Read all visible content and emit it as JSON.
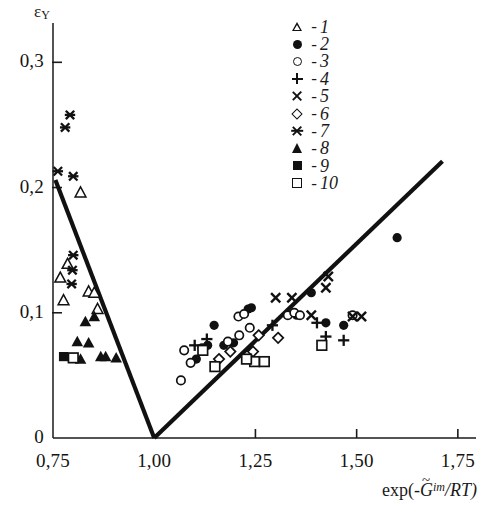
{
  "chart_data": {
    "type": "scatter",
    "title": "",
    "xlabel": "exp(-G̃^im/RT)",
    "ylabel": "ε_Y",
    "xlabel_parts": {
      "prefix": "exp(-",
      "symbol": "G",
      "tilde": "~",
      "sup": "im",
      "suffix": "/RT)"
    },
    "ylabel_parts": {
      "symbol": "ε",
      "sub": "Y"
    },
    "xlim": [
      0.75,
      1.78
    ],
    "ylim": [
      0.0,
      0.325
    ],
    "grid": false,
    "legend_position": "top-right",
    "xticks": [
      0.75,
      1.0,
      1.25,
      1.5,
      1.75
    ],
    "xticklabels": [
      "0,75",
      "1,00",
      "1,25",
      "1,50",
      "1,75"
    ],
    "yticks": [
      0.0,
      0.1,
      0.2,
      0.3
    ],
    "yticklabels": [
      "0",
      "0,1",
      "0,2",
      "0,3"
    ],
    "trend_lines": [
      {
        "name": "left-branch",
        "points": [
          [
            0.756,
            0.206
          ],
          [
            1.0,
            0.0
          ]
        ]
      },
      {
        "name": "right-branch",
        "points": [
          [
            1.0,
            0.0
          ],
          [
            1.712,
            0.221
          ]
        ]
      }
    ],
    "legend": [
      {
        "n": "1",
        "marker": "open-triangle"
      },
      {
        "n": "2",
        "marker": "filled-circle"
      },
      {
        "n": "3",
        "marker": "open-circle"
      },
      {
        "n": "4",
        "marker": "plus"
      },
      {
        "n": "5",
        "marker": "cross"
      },
      {
        "n": "6",
        "marker": "open-diamond"
      },
      {
        "n": "7",
        "marker": "star"
      },
      {
        "n": "8",
        "marker": "filled-triangle"
      },
      {
        "n": "9",
        "marker": "filled-square"
      },
      {
        "n": "10",
        "marker": "open-square"
      }
    ],
    "legend_dash": "-",
    "series": [
      {
        "name": "1",
        "marker": "open-triangle",
        "points": [
          [
            0.818,
            0.196
          ],
          [
            0.786,
            0.139
          ],
          [
            0.768,
            0.128
          ],
          [
            0.838,
            0.117
          ],
          [
            0.776,
            0.11
          ],
          [
            0.86,
            0.103
          ],
          [
            0.852,
            0.116
          ]
        ]
      },
      {
        "name": "2",
        "marker": "filled-circle",
        "points": [
          [
            1.6,
            0.16
          ],
          [
            1.388,
            0.116
          ],
          [
            1.352,
            0.098
          ],
          [
            1.424,
            0.092
          ],
          [
            1.468,
            0.09
          ],
          [
            1.232,
            0.103
          ],
          [
            1.24,
            0.104
          ],
          [
            1.148,
            0.09
          ],
          [
            1.132,
            0.074
          ],
          [
            1.118,
            0.072
          ],
          [
            1.104,
            0.063
          ],
          [
            1.172,
            0.074
          ],
          [
            1.196,
            0.076
          ]
        ]
      },
      {
        "name": "3",
        "marker": "open-circle",
        "points": [
          [
            1.33,
            0.098
          ],
          [
            1.346,
            0.1
          ],
          [
            1.36,
            0.098
          ],
          [
            1.49,
            0.098
          ],
          [
            1.074,
            0.07
          ],
          [
            1.09,
            0.06
          ],
          [
            1.182,
            0.077
          ],
          [
            1.21,
            0.082
          ],
          [
            1.236,
            0.088
          ],
          [
            1.066,
            0.046
          ],
          [
            1.208,
            0.097
          ],
          [
            1.222,
            0.099
          ]
        ]
      },
      {
        "name": "4",
        "marker": "plus",
        "points": [
          [
            1.292,
            0.09
          ],
          [
            1.402,
            0.092
          ],
          [
            1.424,
            0.081
          ],
          [
            1.468,
            0.078
          ],
          [
            1.1,
            0.074
          ],
          [
            1.13,
            0.079
          ]
        ]
      },
      {
        "name": "5",
        "marker": "cross",
        "points": [
          [
            1.43,
            0.129
          ],
          [
            1.424,
            0.12
          ],
          [
            1.3,
            0.112
          ],
          [
            1.34,
            0.112
          ],
          [
            1.388,
            0.098
          ],
          [
            1.49,
            0.097
          ],
          [
            1.512,
            0.097
          ]
        ]
      },
      {
        "name": "6",
        "marker": "open-diamond",
        "points": [
          [
            1.258,
            0.082
          ],
          [
            1.306,
            0.08
          ],
          [
            1.244,
            0.069
          ],
          [
            1.188,
            0.069
          ],
          [
            1.16,
            0.063
          ]
        ]
      },
      {
        "name": "7",
        "marker": "star",
        "points": [
          [
            0.792,
            0.258
          ],
          [
            0.78,
            0.248
          ],
          [
            0.762,
            0.213
          ],
          [
            0.8,
            0.209
          ],
          [
            0.8,
            0.146
          ],
          [
            0.798,
            0.134
          ],
          [
            0.796,
            0.123
          ]
        ]
      },
      {
        "name": "8",
        "marker": "filled-triangle",
        "points": [
          [
            0.852,
            0.097
          ],
          [
            0.83,
            0.093
          ],
          [
            0.81,
            0.077
          ],
          [
            0.838,
            0.076
          ],
          [
            0.868,
            0.065
          ],
          [
            0.88,
            0.065
          ],
          [
            0.906,
            0.064
          ],
          [
            0.818,
            0.063
          ]
        ]
      },
      {
        "name": "9",
        "marker": "filled-square",
        "points": [
          [
            0.776,
            0.065
          ]
        ]
      },
      {
        "name": "10",
        "marker": "open-square",
        "points": [
          [
            0.8,
            0.064
          ],
          [
            1.248,
            0.061
          ],
          [
            1.272,
            0.061
          ],
          [
            1.228,
            0.063
          ],
          [
            1.414,
            0.074
          ],
          [
            1.15,
            0.057
          ],
          [
            1.12,
            0.07
          ]
        ]
      }
    ]
  }
}
